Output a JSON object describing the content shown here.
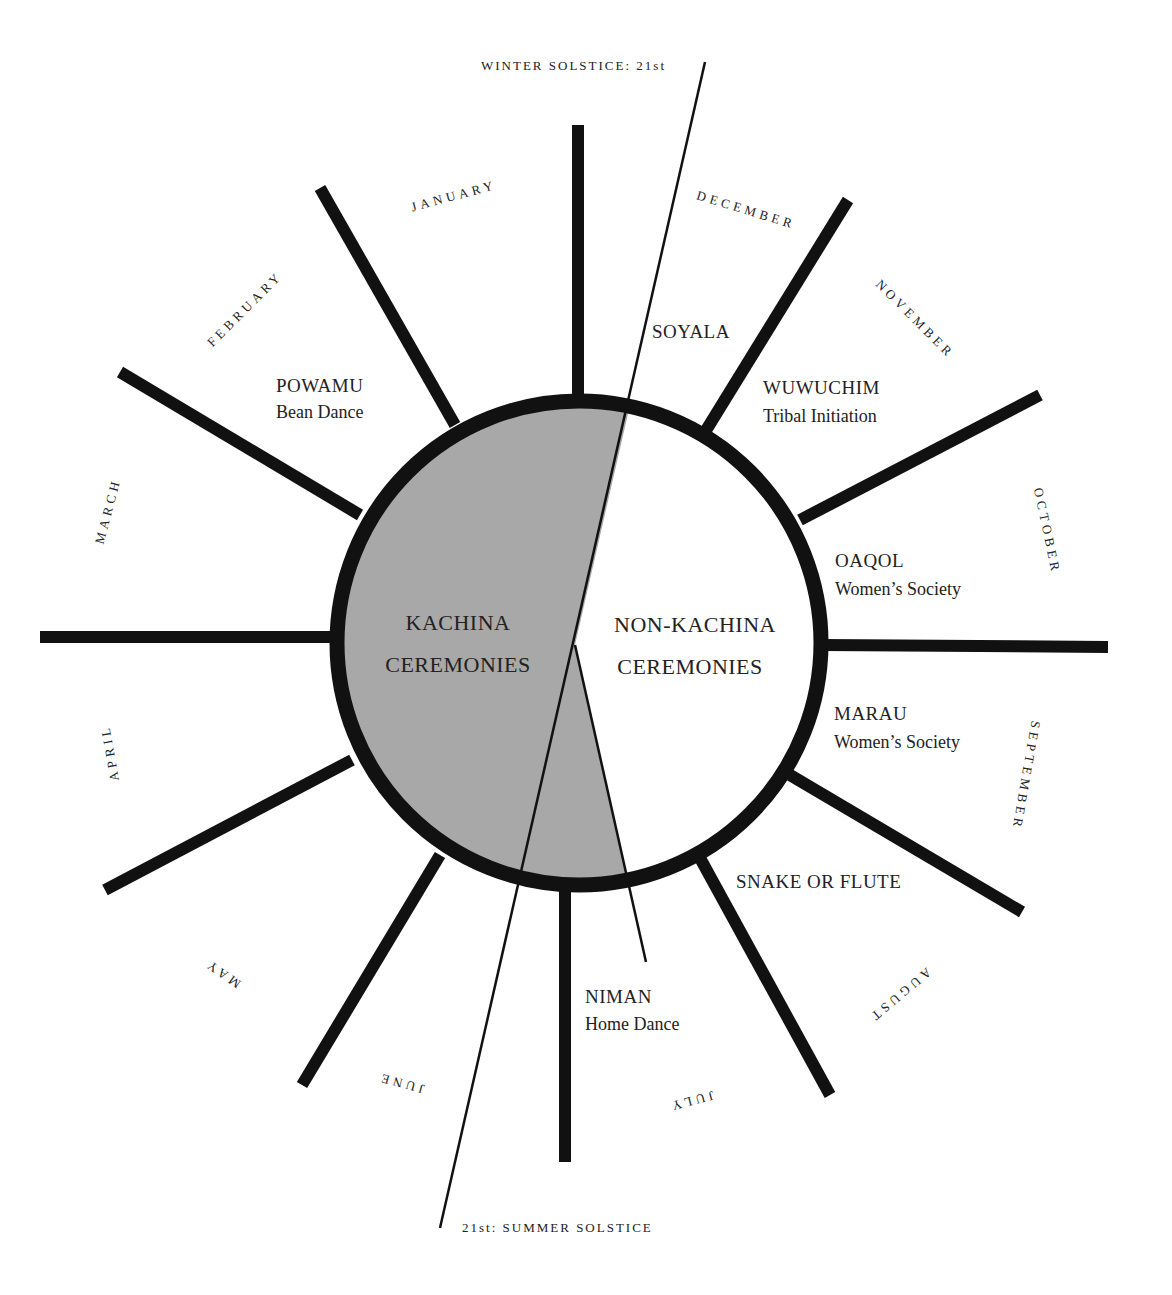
{
  "solstices": {
    "winter": "WINTER SOLSTICE: 21st",
    "summer": "21st: SUMMER SOLSTICE"
  },
  "center": {
    "kachina_line1": "KACHINA",
    "kachina_line2": "CEREMONIES",
    "nonkachina_line1": "NON-KACHINA",
    "nonkachina_line2": "CEREMONIES"
  },
  "months": {
    "january": "JANUARY",
    "february": "FEBRUARY",
    "march": "MARCH",
    "april": "APRIL",
    "may": "MAY",
    "june": "JUNE",
    "july": "JULY",
    "august": "AUGUST",
    "september": "SEPTEMBER",
    "october": "OCTOBER",
    "november": "NOVEMBER",
    "december": "DECEMBER"
  },
  "ceremonies": {
    "powamu": {
      "name": "POWAMU",
      "desc": "Bean Dance"
    },
    "soyala": {
      "name": "SOYALA"
    },
    "wuwuchim": {
      "name": "WUWUCHIM",
      "desc": "Tribal Initiation"
    },
    "oaqol": {
      "name": "OAQOL",
      "desc": "Women’s Society"
    },
    "marau": {
      "name": "MARAU",
      "desc": "Women’s Society"
    },
    "snake": {
      "name": "SNAKE OR FLUTE"
    },
    "niman": {
      "name": "NIMAN",
      "desc": "Home Dance"
    }
  },
  "colors": {
    "kachina_fill": "#a8a8a8",
    "ink": "#111111",
    "background": "#ffffff"
  }
}
